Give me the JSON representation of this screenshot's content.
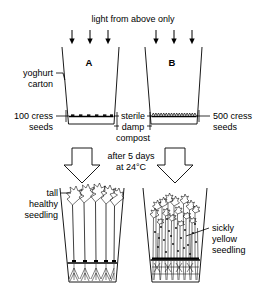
{
  "figure": {
    "background_color": "#ffffff",
    "ink_color": "#000000"
  },
  "top_section": {
    "light_label": "light from above only",
    "light_arrow_count": 6,
    "carton_a_label": "A",
    "carton_b_label": "B",
    "carton_material_label_line1": "yoghurt",
    "carton_material_label_line2": "carton",
    "left_seed_label_line1": "100 cress",
    "left_seed_label_line2": "seeds",
    "right_seed_label_line1": "500 cress",
    "right_seed_label_line2": "seeds",
    "compost_label_line1": "sterile",
    "compost_label_line2": "damp",
    "compost_label_line3": "compost"
  },
  "transition": {
    "duration_label": "after 5 days",
    "temperature_label": "at 24°C",
    "arrow_icon": "down-block-arrow",
    "arrow_count": 2
  },
  "bottom_section": {
    "left_result_line1": "tall",
    "left_result_line2": "healthy",
    "left_result_line3": "seedling",
    "right_result_line1": "sickly",
    "right_result_line2": "yellow",
    "right_result_line3": "seedling",
    "left_seedling_count": 5,
    "right_seedling_count": 18
  },
  "experiment_data": {
    "variable_tested": "seed sowing density",
    "conditions": [
      {
        "carton": "A",
        "seeds": 100,
        "outcome": "tall healthy seedling",
        "medium": "sterile damp compost",
        "light": "from above only"
      },
      {
        "carton": "B",
        "seeds": 500,
        "outcome": "sickly yellow seedling",
        "medium": "sterile damp compost",
        "light": "from above only"
      }
    ],
    "incubation_days": 5,
    "incubation_temperature_c": 24
  }
}
